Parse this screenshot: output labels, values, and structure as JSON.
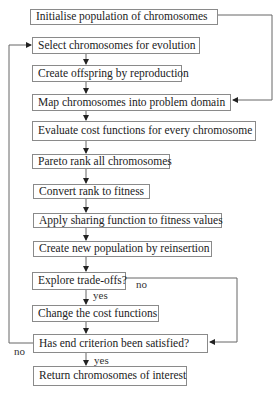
{
  "diagram": {
    "type": "flowchart",
    "steps": [
      {
        "id": "init",
        "label": "Initialise population of chromosomes"
      },
      {
        "id": "select",
        "label": "Select chromosomes for evolution"
      },
      {
        "id": "offspring",
        "label": "Create offspring by reproduction"
      },
      {
        "id": "map",
        "label": "Map chromosomes into problem domain"
      },
      {
        "id": "evaluate",
        "label": "Evaluate cost functions for every chromosome"
      },
      {
        "id": "pareto",
        "label": "Pareto rank all chromosomes"
      },
      {
        "id": "convert",
        "label": "Convert rank to fitness"
      },
      {
        "id": "sharing",
        "label": "Apply sharing function to fitness values"
      },
      {
        "id": "reinsert",
        "label": "Create new population by reinsertion"
      },
      {
        "id": "explore",
        "label": "Explore trade-offs?"
      },
      {
        "id": "change",
        "label": "Change the cost functions"
      },
      {
        "id": "end",
        "label": "Has end criterion been satisfied?"
      },
      {
        "id": "return",
        "label": "Return chromosomes of interest"
      }
    ],
    "edge_labels": {
      "explore_no": "no",
      "explore_yes": "yes",
      "end_no": "no",
      "end_yes": "yes"
    },
    "edges": [
      {
        "from": "init",
        "to": "map"
      },
      {
        "from": "select",
        "to": "offspring"
      },
      {
        "from": "offspring",
        "to": "map"
      },
      {
        "from": "map",
        "to": "evaluate"
      },
      {
        "from": "evaluate",
        "to": "pareto"
      },
      {
        "from": "pareto",
        "to": "convert"
      },
      {
        "from": "convert",
        "to": "sharing"
      },
      {
        "from": "sharing",
        "to": "reinsert"
      },
      {
        "from": "reinsert",
        "to": "explore"
      },
      {
        "from": "explore",
        "to": "change",
        "label": "yes"
      },
      {
        "from": "explore",
        "to": "end",
        "label": "no"
      },
      {
        "from": "change",
        "to": "end"
      },
      {
        "from": "end",
        "to": "select",
        "label": "no"
      },
      {
        "from": "end",
        "to": "return",
        "label": "yes"
      }
    ],
    "colors": {
      "line": "#555555",
      "border": "#8a8a8a",
      "text": "#222222"
    }
  }
}
